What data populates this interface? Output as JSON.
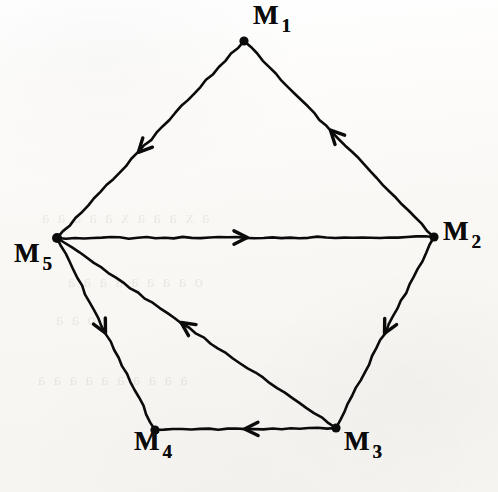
{
  "figure": {
    "kind": "directed-graph",
    "title": "",
    "background_color": "#fbfaf8",
    "ink_color": "#0b0b0b",
    "width": 498,
    "height": 492
  },
  "nodes": [
    {
      "id": "M1",
      "base": "M",
      "sub": "1",
      "x": 244,
      "y": 41,
      "label_x": 253,
      "label_y": 2,
      "dot_r": 4.6
    },
    {
      "id": "M2",
      "base": "M",
      "sub": "2",
      "x": 434,
      "y": 237,
      "label_x": 443,
      "label_y": 218,
      "dot_r": 4.6
    },
    {
      "id": "M3",
      "base": "M",
      "sub": "3",
      "x": 336,
      "y": 428,
      "label_x": 344,
      "label_y": 428,
      "dot_r": 4.6
    },
    {
      "id": "M4",
      "base": "M",
      "sub": "4",
      "x": 155,
      "y": 430,
      "label_x": 134,
      "label_y": 428,
      "dot_r": 4.6
    },
    {
      "id": "M5",
      "base": "M",
      "sub": "5",
      "x": 57,
      "y": 238,
      "label_x": 14,
      "label_y": 240,
      "dot_r": 5.0
    }
  ],
  "edges": [
    {
      "id": "e1",
      "from": "M1",
      "to": "M5",
      "arrow_t": 0.565,
      "label": "M1 to M5"
    },
    {
      "id": "e2",
      "from": "M2",
      "to": "M1",
      "arrow_t": 0.545,
      "label": "M2 to M1"
    },
    {
      "id": "e3",
      "from": "M5",
      "to": "M2",
      "arrow_t": 0.505,
      "label": "M5 to M2"
    },
    {
      "id": "e4",
      "from": "M2",
      "to": "M3",
      "arrow_t": 0.505,
      "label": "M2 to M3"
    },
    {
      "id": "e5",
      "from": "M5",
      "to": "M4",
      "arrow_t": 0.495,
      "label": "M5 to M4"
    },
    {
      "id": "e6",
      "from": "M3",
      "to": "M5",
      "arrow_t": 0.555,
      "label": "M3 to M5"
    },
    {
      "id": "e7",
      "from": "M3",
      "to": "M4",
      "arrow_t": 0.505,
      "label": "M3 to M4"
    }
  ],
  "ghost_text": [
    {
      "text": "a x a a a x a a a a a",
      "x": 40,
      "y": 208,
      "size": 17
    },
    {
      "text": "o a a a a a a a a",
      "x": 66,
      "y": 272,
      "size": 17
    },
    {
      "text": "o a a",
      "x": 54,
      "y": 310,
      "size": 17
    },
    {
      "text": "a a a a a a a a a a",
      "x": 36,
      "y": 370,
      "size": 17
    }
  ]
}
